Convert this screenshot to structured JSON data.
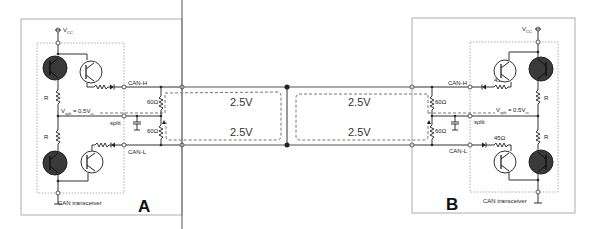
{
  "diagram": {
    "nodes": [
      {
        "id": "A",
        "label": "A",
        "transceiver_label": "CAN transceiver",
        "supply_label": "V",
        "supply_sub": "CC",
        "vsplit_label": "V",
        "vsplit_sub": "split",
        "vsplit_value": " = 0.5V",
        "vsplit_value_sub": "cc",
        "split_label": "split",
        "canh_label": "CAN-H",
        "canl_label": "CAN-L",
        "resistor_upper": "R",
        "resistor_lower": "R",
        "termination_upper": "60Ω",
        "termination_lower": "60Ω"
      },
      {
        "id": "B",
        "label": "B",
        "transceiver_label": "CAN transceiver",
        "supply_label": "V",
        "supply_sub": "CC",
        "vsplit_label": "V",
        "vsplit_sub": "split",
        "vsplit_value": " = 0.5V",
        "vsplit_value_sub": "cc",
        "split_label": "split",
        "canh_label": "CAN-H",
        "canl_label": "CAN-L",
        "resistor_upper": "R",
        "resistor_lower": "R",
        "series_upper": "45Ω",
        "series_lower": "45Ω",
        "termination_upper": "60Ω",
        "termination_lower": "60Ω"
      }
    ],
    "bus": {
      "left_segment": {
        "canh_voltage": "2.5V",
        "canl_voltage": "2.5V"
      },
      "right_segment": {
        "canh_voltage": "2.5V",
        "canl_voltage": "2.5V"
      }
    },
    "icons": [
      "npn-transistor-icon",
      "resistor-icon",
      "diode-icon",
      "capacitor-icon",
      "ground-icon",
      "vcc-terminal-icon"
    ],
    "colors": {
      "wire": "#333333",
      "box": "#999999",
      "transistor_fill": "#3a3a3a"
    }
  }
}
